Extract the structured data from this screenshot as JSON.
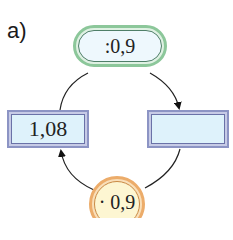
{
  "label": "a)",
  "nodes": {
    "top_operator": ":0,9",
    "left_box": "1,08",
    "right_box": "",
    "bottom_operator": "· 0,9"
  },
  "colors": {
    "top_operator_border": "#8cc79a",
    "box_border": "#8c94c4",
    "box_fill": "#def2fb",
    "bottom_operator_border": "#ecac6a",
    "bottom_operator_fill": "#fdf6d2"
  }
}
